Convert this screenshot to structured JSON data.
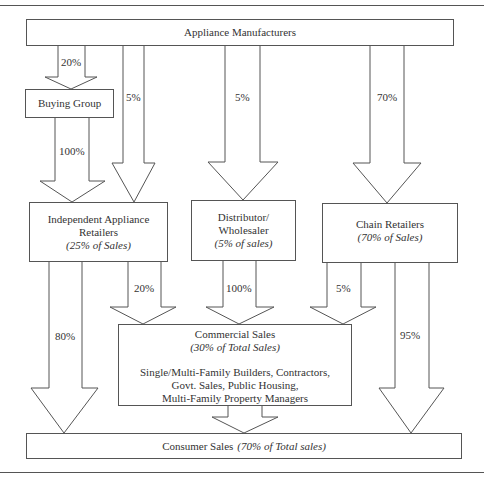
{
  "diagram": {
    "title": "",
    "nodes": {
      "manufacturers": {
        "label": "Appliance Manufacturers"
      },
      "buying_group": {
        "label": "Buying Group"
      },
      "independent": {
        "label_line1": "Independent Appliance",
        "label_line2": "Retailers",
        "share": "(25% of Sales)"
      },
      "distributor": {
        "label_line1": "Distributor/",
        "label_line2": "Wholesaler",
        "share": "(5% of sales)"
      },
      "chain": {
        "label": "Chain Retailers",
        "share": "(70% of Sales)"
      },
      "commercial": {
        "label": "Commercial Sales",
        "share": "(30% of Total Sales)",
        "desc_line1": "Single/Multi-Family Builders, Contractors,",
        "desc_line2": "Govt. Sales, Public Housing,",
        "desc_line3": "Multi-Family Property Managers"
      },
      "consumer": {
        "label": "Consumer Sales",
        "share": "(70% of  Total sales)"
      }
    },
    "flows": {
      "mfr_to_buying": "20%",
      "buying_to_independent": "100%",
      "mfr_to_independent": "5%",
      "mfr_to_distributor": "5%",
      "mfr_to_chain": "70%",
      "independent_to_consumer": "80%",
      "independent_to_commercial": "20%",
      "distributor_to_commercial": "100%",
      "chain_to_commercial": "5%",
      "chain_to_consumer": "95%"
    },
    "colors": {
      "line": "#555555",
      "text": "#333333",
      "background": "#ffffff"
    }
  }
}
